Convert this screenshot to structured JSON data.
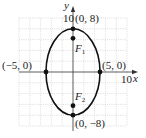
{
  "diagram": {
    "type": "ellipse",
    "equation_params": {
      "a": 5,
      "b": 8,
      "center": [
        0,
        0
      ],
      "major_axis": "vertical"
    },
    "axes": {
      "x_label": "x",
      "y_label": "y",
      "x_tick_label": "10",
      "y_tick_label": "10",
      "range": [
        -10,
        10
      ]
    },
    "grid": {
      "on": true,
      "step": 2
    },
    "points": [
      {
        "name": "top-vertex",
        "label": "(0, 8)",
        "x": 0,
        "y": 8
      },
      {
        "name": "bottom-vertex",
        "label": "(0, −8)",
        "x": 0,
        "y": -8
      },
      {
        "name": "left-vertex",
        "label": "(−5, 0)",
        "x": -5,
        "y": 0
      },
      {
        "name": "right-vertex",
        "label": "(5, 0)",
        "x": 5,
        "y": 0
      }
    ],
    "foci": [
      {
        "name": "focus-1",
        "label": "F",
        "subscript": "1",
        "x": 0,
        "y": 6.24
      },
      {
        "name": "focus-2",
        "label": "F",
        "subscript": "2",
        "x": 0,
        "y": -6.24
      }
    ],
    "colors": {
      "curve": "#111111",
      "grid": "#bdbdbd",
      "axis": "#333333"
    }
  }
}
